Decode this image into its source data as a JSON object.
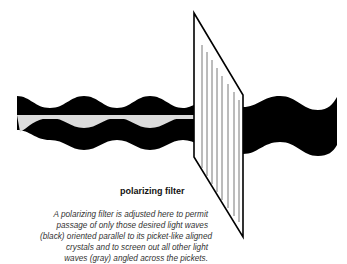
{
  "diagram": {
    "title": "polarizing filter",
    "caption_lines": [
      "A polarizing filter is adjusted here to permit",
      "passage of only those desired light waves",
      "(black) oriented parallel to its picket-like aligned",
      "crystals and to screen out all other light",
      "waves (gray) angled across the pickets."
    ],
    "legend": {
      "black_wave": "desired light waves (black)",
      "gray_wave": "other light waves (gray)"
    },
    "colors": {
      "black_wave": "#000000",
      "gray_wave": "#d9d9d9",
      "filter_outline": "#000000",
      "background": "#ffffff"
    }
  }
}
